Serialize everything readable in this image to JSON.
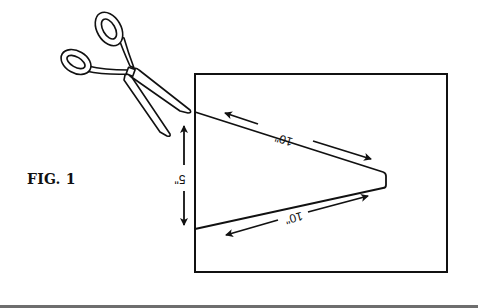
{
  "figure": {
    "label": "FIG. 1",
    "colors": {
      "ink": "#111111",
      "paper": "#ffffff",
      "rule": "#6e6e6e"
    },
    "dimensions": {
      "top_edge": "10\"",
      "bottom_edge": "10\"",
      "base_width": "5\""
    },
    "elements": [
      "scissors-illustration",
      "paper-sheet",
      "triangular-cut-outline",
      "dimension-arrows"
    ]
  }
}
